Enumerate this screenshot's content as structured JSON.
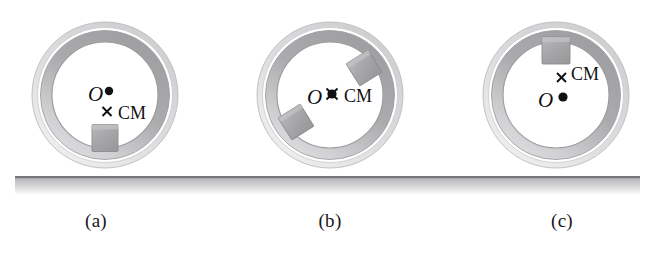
{
  "figure": {
    "kind": "physics-diagram",
    "background_color": "#ffffff",
    "ground": {
      "name": "ground-surface",
      "x": 15,
      "y": 176,
      "width": 625,
      "height": 19,
      "top_edge_color": "#6f6f73",
      "fill_top_color": "#b9b9bb",
      "fill_bottom_color": "#ffffff"
    },
    "hoop_style": {
      "outer_ring_color": "#d8d8da",
      "tube_dark_color": "#a9a9ac",
      "tube_light_color": "#cfcfd2",
      "gap_color": "#ffffff",
      "outline_color": "#9a9a9d",
      "inner_fill": "#ffffff"
    },
    "block_style": {
      "fill_color": "#a8a8ab",
      "edge_color": "#8d8d90",
      "top_highlight": "#c2c2c5"
    },
    "marker_style": {
      "dot_color": "#111113",
      "cross_color": "#111113"
    },
    "panels": [
      {
        "id": "a",
        "label": "(a)",
        "center": {
          "x": 105,
          "y": 95
        },
        "outer_radius": 73,
        "O_label": "O",
        "CM_label": "CM",
        "cm_position": "below-center",
        "cm_coincident_with_O": false,
        "blocks": [
          {
            "name": "block-bottom",
            "angle_deg": 90,
            "rotation_deg": 0
          }
        ]
      },
      {
        "id": "b",
        "label": "(b)",
        "center": {
          "x": 330,
          "y": 95
        },
        "outer_radius": 73,
        "O_label": "O",
        "CM_label": "CM",
        "cm_position": "center",
        "cm_coincident_with_O": true,
        "blocks": [
          {
            "name": "block-upper-right",
            "angle_deg": -38,
            "rotation_deg": -32
          },
          {
            "name": "block-lower-left",
            "angle_deg": 142,
            "rotation_deg": -32
          }
        ]
      },
      {
        "id": "c",
        "label": "(c)",
        "center": {
          "x": 556,
          "y": 95
        },
        "outer_radius": 73,
        "O_label": "O",
        "CM_label": "CM",
        "cm_position": "above-center",
        "cm_coincident_with_O": false,
        "blocks": [
          {
            "name": "block-top",
            "angle_deg": -90,
            "rotation_deg": 0
          }
        ]
      }
    ]
  }
}
